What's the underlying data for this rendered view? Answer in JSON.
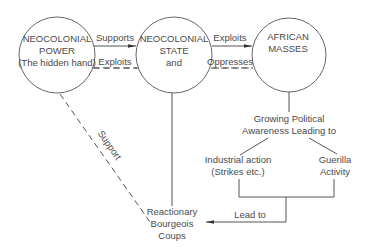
{
  "diagram": {
    "nodes": {
      "neocolonial_power": {
        "line1": "NEOCOLONIAL",
        "line2": "POWER",
        "line3": "(The hidden hand)"
      },
      "neocolonial_state": {
        "line1": "NEOCOLONIAL",
        "line2": "STATE",
        "line3": "and"
      },
      "african_masses": {
        "line1": "AFRICAN",
        "line2": "MASSES"
      },
      "growing_awareness": {
        "line1": "Growing Political",
        "line2": "Awareness Leading to"
      },
      "industrial_action": {
        "line1": "Industrial action",
        "line2": "(Strikes etc.)"
      },
      "guerilla_activity": {
        "line1": "Guerilla",
        "line2": "Activity"
      },
      "coups": {
        "line1": "Reactionary",
        "line2": "Bourgeois",
        "line3": "Coups"
      }
    },
    "edges": {
      "supports": "Supports",
      "exploits_power_state": "Exploits",
      "exploits_state_masses": "Exploits",
      "oppresses": "Oppresses",
      "support_diagonal": "Support",
      "lead_to": "Lead to"
    }
  }
}
